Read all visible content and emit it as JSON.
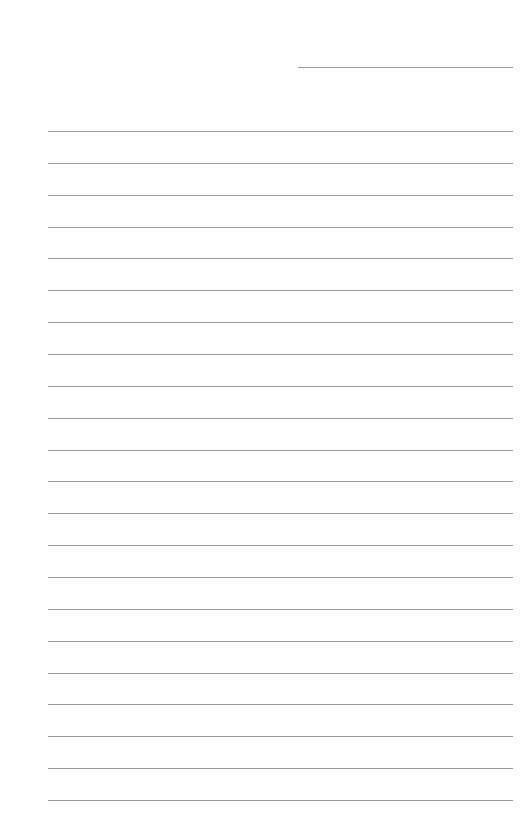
{
  "page": {
    "type": "lined-paper",
    "background": "#fefefe",
    "line_color": "#9a9a9a",
    "header_line": {
      "x": 298,
      "y": 67,
      "width": 215
    },
    "rules": {
      "count": 22,
      "start_y": 131,
      "end_y": 800,
      "x": 48,
      "width": 465
    },
    "text": []
  }
}
